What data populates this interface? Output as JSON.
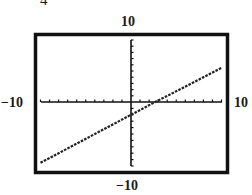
{
  "figure": {
    "corner_label": "4"
  },
  "window": {
    "xmin_label": "−10",
    "xmax_label": "10",
    "ymin_label": "−10",
    "ymax_label": "10"
  },
  "colors": {
    "frame": "#111111",
    "axes": "#111111",
    "line": "#222222",
    "background": "#ffffff"
  },
  "chart_data": {
    "type": "line",
    "title": "",
    "xlabel": "",
    "ylabel": "",
    "xlim": [
      -10,
      10
    ],
    "ylim": [
      -10,
      10
    ],
    "xscale_tick": 1,
    "yscale_tick": 1,
    "grid": false,
    "legend": null,
    "series": [
      {
        "name": "y = 0.75x - 2",
        "style": "dotted-pixel",
        "x": [
          -10,
          -5,
          0,
          2.67,
          5,
          10
        ],
        "y": [
          -9.5,
          -5.75,
          -2,
          0,
          1.75,
          5.5
        ]
      }
    ],
    "annotations": [
      "−10 (left)",
      "10 (right)",
      "10 (top)",
      "−10 (bottom)"
    ]
  }
}
